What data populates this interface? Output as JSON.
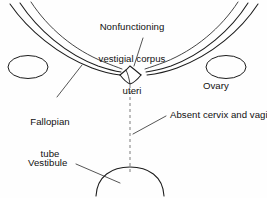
{
  "figure": {
    "background_color": "#fefefe",
    "stroke_color": "#1c1c1c",
    "dashed_color": "#7d7d7d",
    "width": 267,
    "height": 198
  },
  "labels": {
    "corpus_uteri": {
      "line1": "Nonfunctioning",
      "line2": "vestigial corpus",
      "line3": "uteri"
    },
    "ovary": "Ovary",
    "fallopian_tube": {
      "line1": "Fallopian",
      "line2": "tube"
    },
    "absent_cervix_vagina": "Absent cervix and vagina",
    "vestibule": "Vestibule"
  },
  "structures": [
    {
      "name": "left-fallopian-tube",
      "description": "Left fallopian tube drawn as three parallel curved strokes sweeping from upper-left edge down to the midline uterus"
    },
    {
      "name": "right-fallopian-tube",
      "description": "Right fallopian tube drawn as three parallel curved strokes sweeping from upper-right edge down to the midline uterus"
    },
    {
      "name": "left-ovary",
      "description": "Ellipse outline at left, below the left tube"
    },
    {
      "name": "right-ovary",
      "description": "Ellipse outline at right, below the right tube"
    },
    {
      "name": "vestigial-uterus",
      "description": "Small V-shaped notch at the midline where both tubes converge"
    },
    {
      "name": "absent-cervix-vagina-tract",
      "description": "Vertical dashed line from uterus down to the vestibule indicating the missing cervix and vagina"
    },
    {
      "name": "vestibule-arc",
      "description": "Dome-shaped arc at the bottom representing the vestibule"
    }
  ]
}
